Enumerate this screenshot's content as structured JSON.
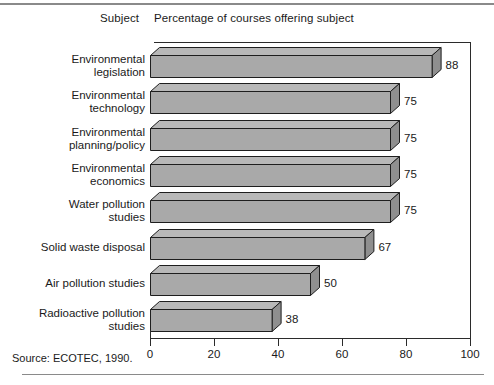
{
  "headers": {
    "subject": "Subject",
    "percentage": "Percentage of courses offering subject"
  },
  "source": "Source: ECOTEC, 1990.",
  "colors": {
    "bar_fill": "#a9a9a9",
    "bar_top_fill": "#b8b8b8",
    "bar_side_fill": "#8f8f8f",
    "outline": "#1e1e1e",
    "axis": "#2b2b2b",
    "rule": "#8a8a8a",
    "text": "#1a1a1a"
  },
  "chart_data": {
    "type": "bar",
    "orientation": "horizontal",
    "title": "Percentage of courses offering subject",
    "xlabel": "",
    "ylabel": "Subject",
    "xlim": [
      0,
      100
    ],
    "xticks": [
      0,
      20,
      40,
      60,
      80,
      100
    ],
    "xticklabels": [
      "0",
      "20",
      "40",
      "60",
      "80",
      "100"
    ],
    "grid": false,
    "legend": false,
    "categories": [
      "Environmental\nlegislation",
      "Environmental\ntechnology",
      "Environmental\nplanning/policy",
      "Environmental\neconomics",
      "Water pollution\nstudies",
      "Solid waste disposal",
      "Air pollution studies",
      "Radioactive pollution\nstudies"
    ],
    "values": [
      88,
      75,
      75,
      75,
      75,
      67,
      50,
      38
    ],
    "datalabels": [
      "88",
      "75",
      "75",
      "75",
      "75",
      "67",
      "50",
      "38"
    ]
  }
}
